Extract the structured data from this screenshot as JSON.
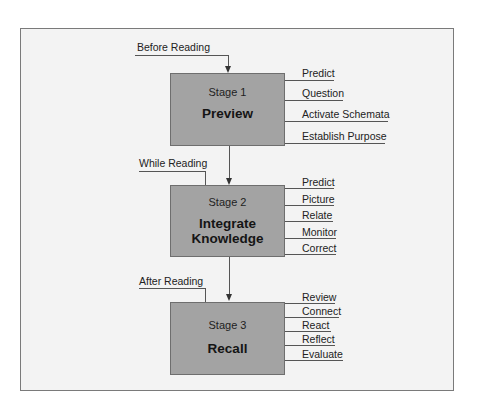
{
  "diagram": {
    "stages": [
      {
        "phase": "Before Reading",
        "number_label": "Stage 1",
        "title_lines": [
          "Preview"
        ],
        "activities": [
          "Predict",
          "Question",
          "Activate Schemata",
          "Establish Purpose"
        ]
      },
      {
        "phase": "While Reading",
        "number_label": "Stage 2",
        "title_lines": [
          "Integrate",
          "Knowledge"
        ],
        "activities": [
          "Predict",
          "Picture",
          "Relate",
          "Monitor",
          "Correct"
        ]
      },
      {
        "phase": "After Reading",
        "number_label": "Stage 3",
        "title_lines": [
          "Recall"
        ],
        "activities": [
          "Review",
          "Connect",
          "React",
          "Reflect",
          "Evaluate"
        ]
      }
    ],
    "colors": {
      "box_fill": "#a3a3a3",
      "background": "#f3f3f3",
      "frame_border": "#7a7a7a"
    }
  }
}
